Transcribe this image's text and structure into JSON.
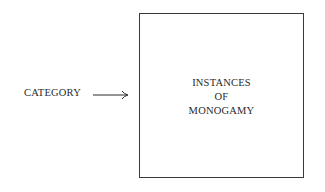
{
  "diagram": {
    "label": "CATEGORY",
    "arrow": "right-arrow",
    "box": {
      "lines": [
        "INSTANCES",
        "OF",
        "MONOGAMY"
      ]
    }
  }
}
